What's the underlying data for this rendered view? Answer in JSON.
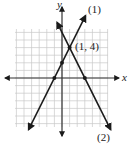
{
  "chart_data": {
    "type": "line",
    "title": "",
    "xlabel": "x",
    "ylabel": "y",
    "grid": true,
    "xlim": [
      -6,
      6
    ],
    "ylim": [
      -6,
      6
    ],
    "series": [
      {
        "name": "(1)",
        "equation": "y = 2x + 2",
        "points": [
          [
            -1,
            0
          ],
          [
            0,
            2
          ],
          [
            1,
            4
          ]
        ]
      },
      {
        "name": "(2)",
        "equation": "y = -2x + 6",
        "points": [
          [
            1,
            4
          ],
          [
            3,
            0
          ]
        ]
      }
    ],
    "annotations": [
      {
        "text": "(1, 4)",
        "x": 1,
        "y": 4
      }
    ]
  },
  "labels": {
    "x_axis": "x",
    "y_axis": "y",
    "line1": "(1)",
    "line2": "(2)",
    "intersection": "(1, 4)"
  },
  "colors": {
    "grid": "#c8c8c8",
    "axis": "#333333",
    "line": "#1a1a1a"
  }
}
